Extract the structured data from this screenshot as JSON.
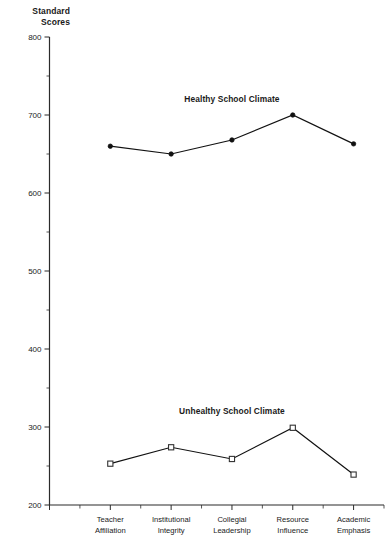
{
  "chart_data": {
    "type": "line",
    "title": "",
    "ylabel": "Standard\nScores",
    "xlabel": "",
    "ylim": [
      200,
      800
    ],
    "ytick_values": [
      200,
      300,
      400,
      500,
      600,
      700,
      800
    ],
    "ytick_labels": [
      "200",
      "300",
      "400",
      "500",
      "600",
      "700",
      "800"
    ],
    "yminor_values": [
      250,
      350,
      450,
      550,
      650,
      750
    ],
    "grid": false,
    "legend_position": "inline-annotation",
    "categories": [
      "Teacher Affiliation",
      "Institutional Integrity",
      "Collegial Leadership",
      "Resource Influence",
      "Academic Emphasis"
    ],
    "category_lines": [
      [
        "Teacher",
        "Affiliation"
      ],
      [
        "Institutional",
        "Integrity"
      ],
      [
        "Collegial",
        "Leadership"
      ],
      [
        "Resource",
        "Influence"
      ],
      [
        "Academic",
        "Emphasis"
      ]
    ],
    "series": [
      {
        "name": "Healthy School Climate",
        "marker": "filled-circle",
        "values": [
          660,
          650,
          668,
          700,
          663
        ]
      },
      {
        "name": "Unhealthy School Climate",
        "marker": "open-square",
        "values": [
          253,
          274,
          259,
          299,
          239
        ]
      }
    ],
    "annotations": [
      {
        "text": "Healthy School Climate",
        "x_category_index": 2,
        "y": 717
      },
      {
        "text": "Unhealthy School Climate",
        "x_category_index": 2,
        "y": 317
      }
    ]
  },
  "colors": {
    "axis": "#2b2b2b",
    "line": "#111111",
    "marker_fill": "#111111",
    "marker_open_fill": "#ffffff",
    "background": "#ffffff"
  }
}
